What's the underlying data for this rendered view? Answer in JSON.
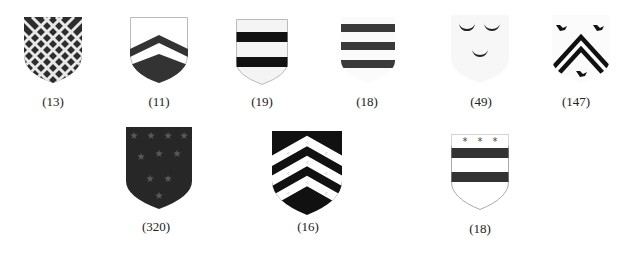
{
  "figure": {
    "rows": [
      {
        "shields": [
          {
            "id": "s1",
            "design": "fretty-lattice",
            "label": "(13)"
          },
          {
            "id": "s2",
            "design": "chevron-base",
            "label": "(11)"
          },
          {
            "id": "s3",
            "design": "two-bars",
            "label": "(19)"
          },
          {
            "id": "s4",
            "design": "three-bars",
            "label": "(18)"
          },
          {
            "id": "s5",
            "design": "three-crescents",
            "label": "(49)"
          },
          {
            "id": "s6",
            "design": "two-chevronels-three-birds",
            "label": "(147)"
          }
        ]
      },
      {
        "shields": [
          {
            "id": "s7",
            "design": "semy-of-stars",
            "label": "(320)"
          },
          {
            "id": "s8",
            "design": "three-chevronels-ermine",
            "label": "(16)"
          },
          {
            "id": "s9",
            "design": "two-bars-chief-three-mullets",
            "label": "(18)"
          }
        ]
      }
    ],
    "colors": {
      "dark": "#2a2a2a",
      "black": "#111111",
      "light": "#f6f6f6",
      "stars": "#555555"
    }
  }
}
